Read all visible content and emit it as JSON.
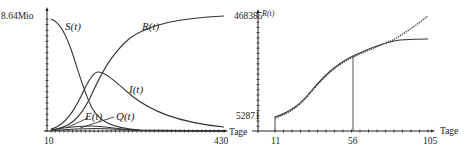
{
  "chart_data": [
    {
      "type": "line",
      "title": "",
      "xlabel": "Tage",
      "ylabel": "",
      "x_ticks": [
        "10",
        "430"
      ],
      "xlim": [
        10,
        430
      ],
      "y_ticks": [
        "8.64Mio"
      ],
      "ylim": [
        0,
        8640000
      ],
      "grid": false,
      "legend": "inline labels",
      "series": [
        {
          "name": "S(t)",
          "x": [
            10,
            60,
            100,
            140,
            180,
            230,
            300,
            430
          ],
          "values": [
            8450000,
            7000000,
            4200000,
            1500000,
            500000,
            200000,
            80000,
            30000
          ]
        },
        {
          "name": "R(t)",
          "x": [
            10,
            60,
            100,
            140,
            180,
            230,
            300,
            430
          ],
          "values": [
            0,
            200000,
            1200000,
            3200000,
            5000000,
            6500000,
            7600000,
            8400000
          ]
        },
        {
          "name": "I(t)",
          "x": [
            10,
            60,
            100,
            130,
            160,
            200,
            260,
            330,
            430
          ],
          "values": [
            50000,
            1200000,
            3000000,
            3700000,
            3400000,
            2500000,
            1400000,
            700000,
            200000
          ]
        },
        {
          "name": "E(t)",
          "x": [
            10,
            60,
            100,
            150,
            200,
            300,
            430
          ],
          "values": [
            20000,
            250000,
            450000,
            350000,
            150000,
            40000,
            10000
          ]
        },
        {
          "name": "Q(t)",
          "x": [
            10,
            60,
            100,
            150,
            200,
            300,
            430
          ],
          "values": [
            10000,
            120000,
            200000,
            150000,
            70000,
            20000,
            5000
          ]
        }
      ],
      "labels": {
        "y_top": "8.64Mio",
        "x_start": "10",
        "x_end": "430",
        "x_axis": "Tage",
        "S": "S(t)",
        "R": "R(t)",
        "I": "I(t)",
        "E": "E(t)",
        "Q": "Q(t)"
      }
    },
    {
      "type": "line",
      "title": "",
      "xlabel": "Tage",
      "ylabel": "R(t)",
      "x_ticks": [
        "11",
        "56",
        "105"
      ],
      "xlim": [
        11,
        105
      ],
      "y_ticks": [
        "52871",
        "468385"
      ],
      "ylim": [
        52871,
        468385
      ],
      "grid": false,
      "series": [
        {
          "name": "model R(t)",
          "style": "solid",
          "x": [
            11,
            20,
            30,
            40,
            50,
            56,
            65,
            75,
            85,
            95,
            105
          ],
          "values": [
            55000,
            80000,
            130000,
            200000,
            260000,
            285000,
            315000,
            335000,
            345000,
            350000,
            352000
          ]
        },
        {
          "name": "data",
          "style": "dotted",
          "x": [
            11,
            20,
            30,
            40,
            50,
            56,
            65,
            75,
            85,
            95,
            105
          ],
          "values": [
            52871,
            75000,
            125000,
            195000,
            258000,
            283000,
            320000,
            360000,
            400000,
            435000,
            468385
          ]
        }
      ],
      "marker_line_x": 56,
      "labels": {
        "y_axis": "R(t)",
        "y_top": "468385",
        "y_bottom": "52871",
        "x_start": "11",
        "x_mid": "56",
        "x_end": "105",
        "x_axis": "Tage"
      }
    }
  ]
}
